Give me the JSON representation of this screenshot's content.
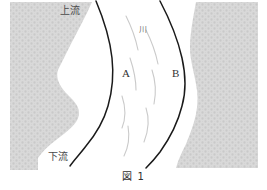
{
  "figure": {
    "caption": "図 1",
    "background_color": "#ffffff",
    "land_fill_color": "#d5d5d5",
    "bank_line_color": "#1a1a1a",
    "flow_line_color": "#c9c9c9",
    "edge_fragment": "。"
  },
  "labels": {
    "upstream": "上流",
    "downstream": "下流",
    "river": "川",
    "region_a": "A",
    "region_b": "B"
  },
  "diagram_data": {
    "type": "diagram",
    "subject": "river-meander-cross-section",
    "elements": [
      {
        "name": "left-land",
        "kind": "shaded-region",
        "side": "left"
      },
      {
        "name": "right-land",
        "kind": "shaded-region",
        "side": "right"
      },
      {
        "name": "river-channel",
        "kind": "white-channel"
      },
      {
        "name": "left-bank-line",
        "kind": "curve"
      },
      {
        "name": "right-bank-line",
        "kind": "curve"
      },
      {
        "name": "flow-lines",
        "kind": "curve-group",
        "count": 7
      }
    ],
    "annotations": [
      "上流",
      "下流",
      "川",
      "A",
      "B"
    ]
  }
}
